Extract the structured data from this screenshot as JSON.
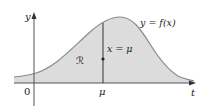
{
  "figure": {
    "y_axis_label": "y",
    "x_axis_label": "t",
    "origin_label": "0",
    "mu_tick_label": "μ",
    "curve_label": "y = f(x)",
    "vertical_line_label": "x = μ",
    "region_label": "ℛ"
  },
  "colors": {
    "fill": "#dcdcdc",
    "curve": "#8a8a8a",
    "axes": "#333333",
    "text": "#222222"
  }
}
